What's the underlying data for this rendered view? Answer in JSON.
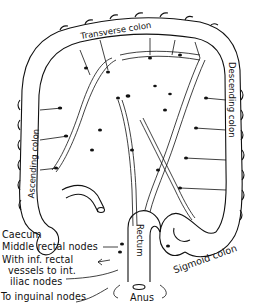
{
  "figure": {
    "colors": {
      "ink": "#111111",
      "background": "#ffffff",
      "shading": "#cfcfcf"
    }
  },
  "labels": {
    "transverse_colon": "Transverse colon",
    "ascending_colon": "Ascending colon",
    "descending_colon": "Descending colon",
    "caecum": "Caecum",
    "middle_rectal_nodes": "Middle rectal nodes",
    "inf_rectal_line1": "With inf. rectal",
    "inf_rectal_line2": "vessels to int.",
    "inf_rectal_line3": "iliac nodes",
    "inguinal_nodes": "To inguinal nodes",
    "rectum": "Rectum",
    "sigmoid_colon": "Sigmoid colon",
    "anus": "Anus"
  }
}
